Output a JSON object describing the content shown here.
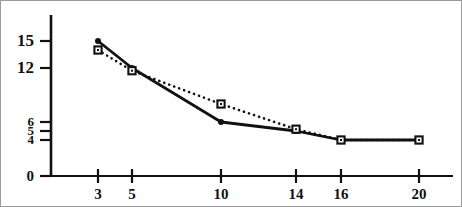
{
  "chart_data": {
    "type": "line",
    "title": "",
    "subtitle": "",
    "xlabel": "",
    "ylabel": "",
    "x": [
      3,
      5,
      10,
      14,
      16,
      20
    ],
    "xtick_labels": [
      "3",
      "5",
      "10",
      "14",
      "16",
      "20"
    ],
    "ytick_labels": [
      "15",
      "12",
      "6",
      "5",
      "4",
      "0"
    ],
    "ytick_values": [
      15,
      12,
      6,
      5,
      4,
      0
    ],
    "xlim": [
      0,
      22
    ],
    "ylim": [
      0,
      16.5
    ],
    "grid": false,
    "legend": "none",
    "series": [
      {
        "name": "series-solid",
        "style": "solid",
        "marker": "filled-circle",
        "color": "#111111",
        "values": [
          15,
          12,
          6,
          5,
          4,
          4
        ]
      },
      {
        "name": "series-dotted",
        "style": "dotted",
        "marker": "open-square",
        "color": "#111111",
        "values": [
          14,
          11.7,
          8,
          5.2,
          4,
          4
        ]
      }
    ]
  },
  "axes": {
    "axis_color": "#111111",
    "frame_color": "#9a9a9a",
    "background": "#ffffff"
  }
}
